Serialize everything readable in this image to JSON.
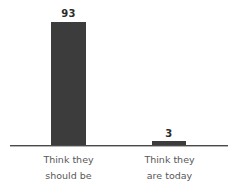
{
  "chart_data": {
    "type": "bar",
    "title": "",
    "subtitle": "",
    "xlabel": "",
    "ylabel": "",
    "categories": [
      "Think they should be",
      "Think they are today"
    ],
    "category_lines": [
      [
        "Think they",
        "should be"
      ],
      [
        "Think they",
        "are today"
      ]
    ],
    "values": [
      93,
      3
    ],
    "data_labels": [
      "93",
      "3"
    ],
    "ylim": [
      0,
      100
    ],
    "grid": false,
    "legend": false,
    "legend_position": "none",
    "axis_visible": {
      "x": true,
      "y": false
    },
    "tick_labels": {
      "x": [
        "Think they should be",
        "Think they are today"
      ],
      "y": []
    },
    "colors": {
      "bar": "#3c3c3c",
      "axis": "#4a4a4a",
      "data_label": "#2b2b2b",
      "category_label": "#585858",
      "background": "#ffffff"
    }
  },
  "labels": {
    "value_1": "93",
    "value_2": "3",
    "category_1": "Think they\nshould be",
    "category_2": "Think they\nare today"
  }
}
